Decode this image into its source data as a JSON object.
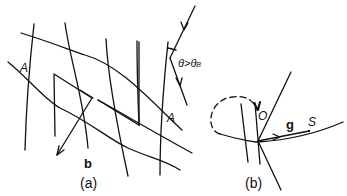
{
  "panel_a": {
    "caption": "(a)",
    "label_A_left": "A",
    "label_A_right": "A",
    "vector_label": "b",
    "angle_label": "θ>θ",
    "angle_subscript": "B"
  },
  "panel_b": {
    "caption": "(b)",
    "point_O": "O",
    "vector_label": "g",
    "point_S": "S"
  },
  "colors": {
    "ink": "#111111",
    "background": "#ffffff"
  }
}
